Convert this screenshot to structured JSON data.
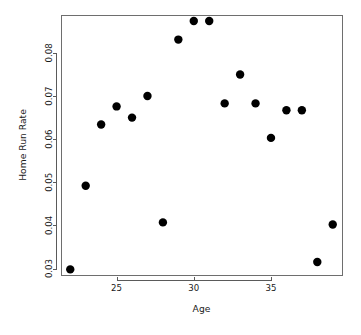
{
  "chart_data": {
    "type": "scatter",
    "title": "",
    "xlabel": "Age",
    "ylabel": "Home Run Rate",
    "xlim": [
      21.4,
      39.6
    ],
    "ylim": [
      0.0285,
      0.0888
    ],
    "grid": false,
    "legend": null,
    "x_ticks": [
      25,
      30,
      35
    ],
    "x_tick_labels": [
      "25",
      "30",
      "35"
    ],
    "y_ticks": [
      0.03,
      0.04,
      0.05,
      0.06,
      0.07,
      0.08
    ],
    "y_tick_labels": [
      "0.03",
      "0.04",
      "0.05",
      "0.06",
      "0.07",
      "0.08"
    ],
    "marker": "filled-circle",
    "marker_color": "#000000",
    "marker_size": 4.2,
    "x": [
      22,
      23,
      24,
      25,
      26,
      27,
      28,
      29,
      30,
      31,
      32,
      33,
      34,
      35,
      36,
      37,
      38,
      39
    ],
    "y": [
      0.0298,
      0.0492,
      0.0634,
      0.0676,
      0.065,
      0.07,
      0.0407,
      0.0831,
      0.0874,
      0.0874,
      0.0683,
      0.075,
      0.0683,
      0.0603,
      0.0667,
      0.0667,
      0.0315,
      0.0402
    ],
    "points": [
      {
        "age": 22,
        "rate": 0.0298
      },
      {
        "age": 23,
        "rate": 0.0492
      },
      {
        "age": 24,
        "rate": 0.0634
      },
      {
        "age": 25,
        "rate": 0.0676
      },
      {
        "age": 26,
        "rate": 0.065
      },
      {
        "age": 27,
        "rate": 0.07
      },
      {
        "age": 28,
        "rate": 0.0407
      },
      {
        "age": 29,
        "rate": 0.0831
      },
      {
        "age": 30,
        "rate": 0.0874
      },
      {
        "age": 31,
        "rate": 0.0874
      },
      {
        "age": 32,
        "rate": 0.0683
      },
      {
        "age": 33,
        "rate": 0.075
      },
      {
        "age": 34,
        "rate": 0.0683
      },
      {
        "age": 35,
        "rate": 0.0603
      },
      {
        "age": 36,
        "rate": 0.0667
      },
      {
        "age": 37,
        "rate": 0.0667
      },
      {
        "age": 38,
        "rate": 0.0315
      },
      {
        "age": 39,
        "rate": 0.0402
      }
    ]
  },
  "layout": {
    "plot_left": 61,
    "plot_right": 342,
    "plot_top": 15,
    "plot_bottom": 275,
    "x_axis_y": 280,
    "y_axis_x": 56,
    "background": "#ffffff",
    "axis_color": "#5a5a5a",
    "frame_color": "#6e6e6e",
    "text_color": "#1a1a1a"
  }
}
